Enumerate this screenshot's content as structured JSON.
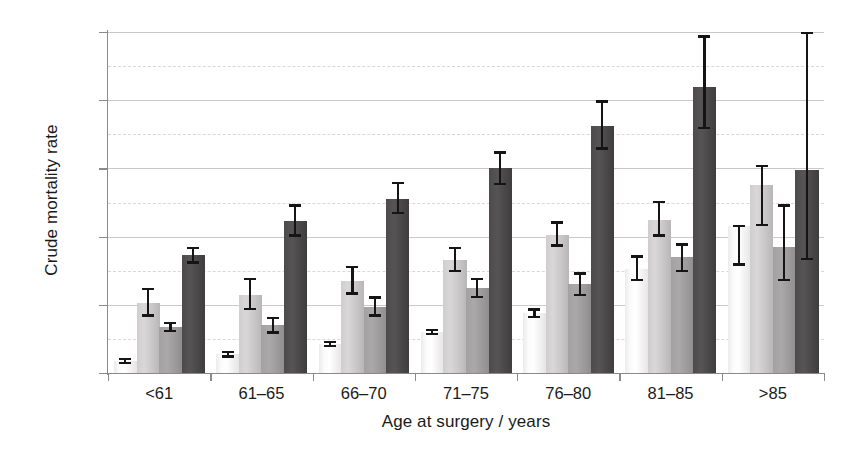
{
  "chart_data": {
    "type": "bar",
    "title": "",
    "xlabel": "Age at surgery / years",
    "ylabel": "Crude mortality rate",
    "categories": [
      "<61",
      "61–65",
      "66–70",
      "71–75",
      "76–80",
      "81–85",
      ">85"
    ],
    "ylim": [
      0,
      20
    ],
    "ytick_labels": [
      "0%",
      "4%",
      "8%",
      "12%",
      "16%",
      "20%"
    ],
    "ytick_values": [
      0,
      4,
      8,
      12,
      16,
      20
    ],
    "minor_gridline_values": [
      2,
      6,
      10,
      14,
      18
    ],
    "grid": true,
    "legend": "none",
    "units": "percent",
    "series": [
      {
        "name": "series-1",
        "color": "#f2f0f0",
        "values": [
          0.7,
          1.1,
          1.7,
          2.4,
          3.5,
          6.1,
          8.6
        ],
        "error_low": [
          0.5,
          0.9,
          1.5,
          2.2,
          3.2,
          5.4,
          6.3
        ],
        "error_high": [
          0.9,
          1.3,
          1.9,
          2.6,
          3.8,
          6.9,
          8.7
        ]
      },
      {
        "name": "series-2",
        "color": "#cccaca",
        "values": [
          4.1,
          4.6,
          5.4,
          6.6,
          8.1,
          9.0,
          11.0
        ],
        "error_low": [
          3.3,
          3.7,
          4.6,
          5.9,
          7.4,
          8.0,
          8.6
        ],
        "error_high": [
          5.0,
          5.6,
          6.3,
          7.4,
          8.9,
          10.1,
          12.2
        ]
      },
      {
        "name": "series-3",
        "color": "#a09e9e",
        "values": [
          2.7,
          2.8,
          3.9,
          5.0,
          5.2,
          6.8,
          7.4
        ],
        "error_low": [
          2.4,
          2.3,
          3.3,
          4.4,
          4.5,
          5.9,
          5.4
        ],
        "error_high": [
          3.0,
          3.3,
          4.5,
          5.6,
          5.9,
          7.6,
          9.9
        ]
      },
      {
        "name": "series-4",
        "color": "#4a4848",
        "values": [
          6.9,
          8.9,
          10.2,
          12.0,
          14.5,
          16.8,
          11.9
        ],
        "error_low": [
          6.4,
          8.0,
          9.3,
          11.0,
          13.1,
          14.3,
          6.6
        ],
        "error_high": [
          7.4,
          9.9,
          11.2,
          13.0,
          16.0,
          19.8,
          20.0
        ]
      }
    ]
  }
}
